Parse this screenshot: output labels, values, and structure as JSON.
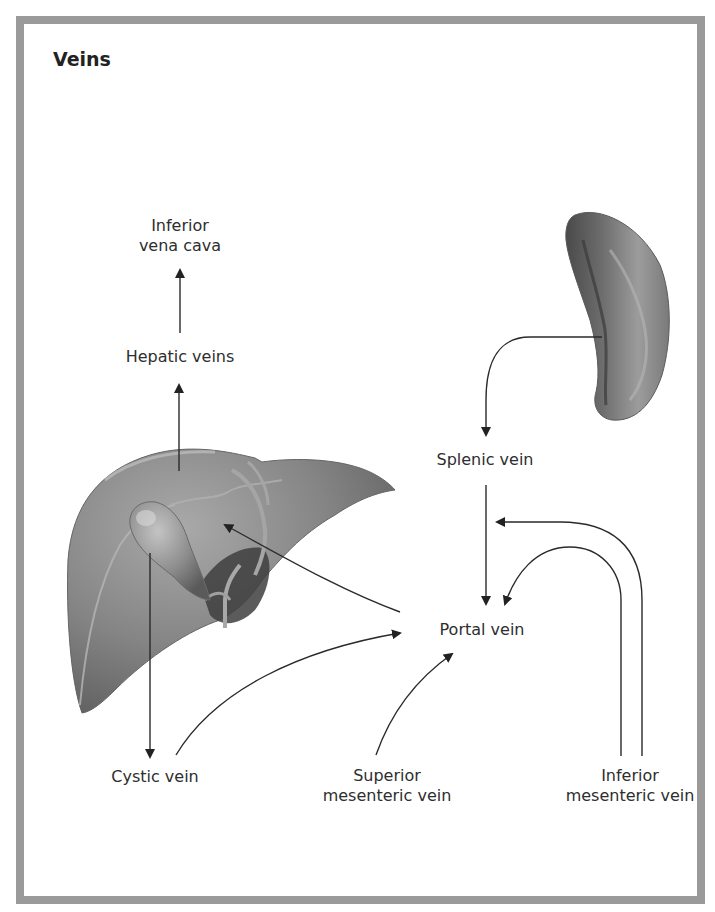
{
  "figure": {
    "title": "Veins",
    "nodes": {
      "ivc_line1": "Inferior",
      "ivc_line2": "vena cava",
      "hepatic": "Hepatic veins",
      "splenic": "Splenic vein",
      "portal": "Portal vein",
      "cystic": "Cystic vein",
      "smv_line1": "Superior",
      "smv_line2": "mesenteric vein",
      "imv_line1": "Inferior",
      "imv_line2": "mesenteric vein"
    },
    "organs": [
      "liver",
      "gallbladder",
      "spleen"
    ],
    "flows": [
      {
        "from": "Hepatic veins",
        "to": "Inferior vena cava"
      },
      {
        "from": "Liver",
        "to": "Hepatic veins"
      },
      {
        "from": "Spleen",
        "to": "Splenic vein"
      },
      {
        "from": "Splenic vein",
        "to": "Portal vein"
      },
      {
        "from": "Inferior mesenteric vein",
        "to": "Splenic vein"
      },
      {
        "from": "Inferior mesenteric vein",
        "to": "Portal vein"
      },
      {
        "from": "Portal vein",
        "to": "Liver"
      },
      {
        "from": "Gallbladder",
        "to": "Cystic vein"
      },
      {
        "from": "Cystic vein",
        "to": "Portal vein"
      },
      {
        "from": "Superior mesenteric vein",
        "to": "Portal vein"
      }
    ],
    "colors": {
      "border": "#9a9a9a",
      "text": "#2e2e2e",
      "arrow": "#2a2a2a",
      "organ": "#8c8c8c"
    }
  }
}
